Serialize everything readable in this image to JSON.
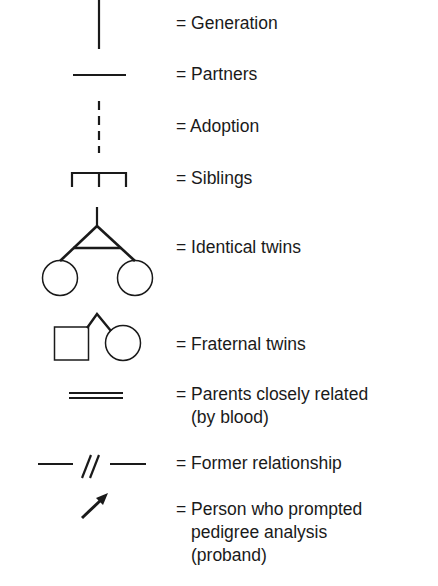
{
  "legend": {
    "items": [
      {
        "symbol": "generation-line",
        "lines": [
          "= Generation"
        ]
      },
      {
        "symbol": "partners-line",
        "lines": [
          "= Partners"
        ]
      },
      {
        "symbol": "adoption-dashed-line",
        "lines": [
          "= Adoption"
        ]
      },
      {
        "symbol": "siblings-bracket",
        "lines": [
          "= Siblings"
        ]
      },
      {
        "symbol": "identical-twins",
        "lines": [
          "= Identical twins"
        ]
      },
      {
        "symbol": "fraternal-twins",
        "lines": [
          "= Fraternal twins"
        ]
      },
      {
        "symbol": "consanguinity-double-line",
        "lines": [
          "= Parents closely related",
          "(by blood)"
        ]
      },
      {
        "symbol": "former-relationship-line",
        "lines": [
          "= Former relationship"
        ]
      },
      {
        "symbol": "proband-arrow",
        "lines": [
          "= Person who prompted",
          "pedigree analysis",
          "(proband)"
        ]
      }
    ]
  },
  "colors": {
    "stroke": "#1a1a1a",
    "background": "#ffffff"
  }
}
